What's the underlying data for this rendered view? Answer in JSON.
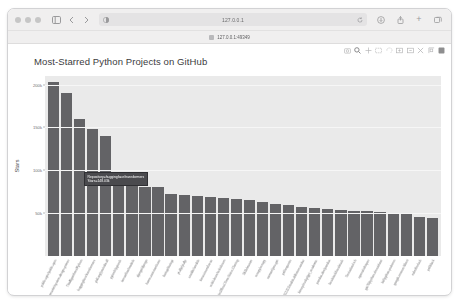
{
  "window": {
    "traffic_lights": [
      "close",
      "minimize",
      "zoom"
    ]
  },
  "toolbar": {
    "sidebar_icon": "sidebar-icon",
    "back_label": "‹",
    "forward_label": "›",
    "url_value": "127.0.0.1",
    "reader_icon": "reader-view-icon",
    "reload_icon": "reload-icon",
    "share_icon": "share-icon",
    "newtab_label": "+",
    "tabs_overview_icon": "tabs-overview-icon"
  },
  "tabstrip": {
    "tab_title": "127.0.0.1:49349"
  },
  "modebar": {
    "buttons": [
      "camera-icon",
      "zoom-in-magnifier-icon",
      "pan-icon",
      "box-select-icon",
      "lasso-select-icon",
      "zoom-in-icon",
      "zoom-out-icon",
      "autoscale-icon",
      "reset-axes-icon",
      "plotly-logo-icon"
    ]
  },
  "chart_data": {
    "type": "bar",
    "title": "Most-Starred Python Projects on GitHub",
    "xlabel": "Repository",
    "ylabel": "Stars",
    "ylim": [
      0,
      210000
    ],
    "yticks": [
      "50k",
      "100k",
      "150k",
      "200k"
    ],
    "ytick_values": [
      50000,
      100000,
      150000,
      200000
    ],
    "grid": true,
    "legend": "none",
    "bar_color": "#636366",
    "plot_bgcolor": "#eaeaea",
    "categories": [
      "public-apis/public-apis",
      "donnemartin/system-design-primer",
      "TheAlgorithms/Python",
      "huggingface/transformers",
      "ytdl-org/youtube-dl",
      "pytorch/pytorch",
      "tensorflow/models",
      "django/django",
      "home-assistant/core",
      "fastapi/fastapi",
      "yt-dlp/yt-dlp",
      "ansible/ansible",
      "keras-team/keras",
      "scikit-learn/scikit-learn",
      "CorentinJ/Real-Time-Voice-Cloning",
      "3b1b/manim",
      "scrapy/scrapy",
      "soimort/you-get",
      "psf/requests",
      "AUTOMATIC1111/stable-diffusion-webui",
      "binary-husky/gpt_academic",
      "pandas-dev/pandas",
      "localstack/localstack",
      "Textualize/rich",
      "openai/whisper",
      "gto76/python-cheatsheet",
      "faif/python-patterns",
      "google-research/bert",
      "nvbn/thefuck",
      "psf/black"
    ],
    "values": [
      203000,
      190000,
      160000,
      148000,
      140000,
      92000,
      88000,
      80000,
      80000,
      72000,
      71000,
      70000,
      69000,
      68000,
      66000,
      65000,
      63000,
      61000,
      59000,
      57000,
      56000,
      55000,
      54000,
      53000,
      52000,
      51000,
      50000,
      49000,
      45000,
      44000
    ]
  },
  "tooltip": {
    "line1": "Repository=huggingface/transformers",
    "line2": "Stars=148.03k"
  }
}
